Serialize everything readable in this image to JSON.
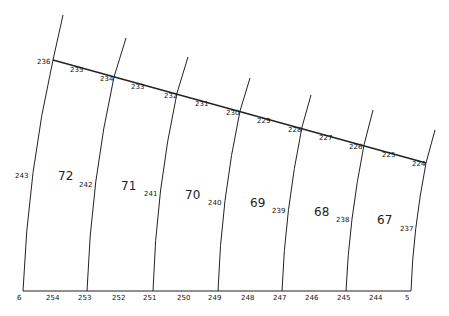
{
  "title": "",
  "diagram": {
    "lots": [
      {
        "number": "72",
        "x": 58,
        "y": 180
      },
      {
        "number": "71",
        "x": 121,
        "y": 190
      },
      {
        "number": "70",
        "x": 185,
        "y": 199
      },
      {
        "number": "69",
        "x": 250,
        "y": 207
      },
      {
        "number": "68",
        "x": 314,
        "y": 216
      },
      {
        "number": "67",
        "x": 377,
        "y": 224
      }
    ],
    "top_boundary_points": [
      {
        "label": "236",
        "x": 37,
        "y": 64
      },
      {
        "label": "235",
        "x": 70,
        "y": 72
      },
      {
        "label": "234",
        "x": 100,
        "y": 81
      },
      {
        "label": "233",
        "x": 131,
        "y": 89
      },
      {
        "label": "232",
        "x": 164,
        "y": 98
      },
      {
        "label": "231",
        "x": 195,
        "y": 106
      },
      {
        "label": "230",
        "x": 226,
        "y": 115
      },
      {
        "label": "229",
        "x": 257,
        "y": 123
      },
      {
        "label": "228",
        "x": 288,
        "y": 132
      },
      {
        "label": "227",
        "x": 319,
        "y": 140
      },
      {
        "label": "226",
        "x": 349,
        "y": 149
      },
      {
        "label": "225",
        "x": 382,
        "y": 157
      },
      {
        "label": "224",
        "x": 412,
        "y": 166
      }
    ],
    "side_points": [
      {
        "label": "243",
        "x": 15,
        "y": 178
      },
      {
        "label": "242",
        "x": 79,
        "y": 187
      },
      {
        "label": "241",
        "x": 144,
        "y": 196
      },
      {
        "label": "240",
        "x": 208,
        "y": 205
      },
      {
        "label": "239",
        "x": 272,
        "y": 213
      },
      {
        "label": "238",
        "x": 336,
        "y": 222
      },
      {
        "label": "237",
        "x": 400,
        "y": 231
      }
    ],
    "bottom_points": [
      {
        "label": "6",
        "x": 17,
        "y": 300
      },
      {
        "label": "254",
        "x": 46,
        "y": 300
      },
      {
        "label": "253",
        "x": 78,
        "y": 300
      },
      {
        "label": "252",
        "x": 112,
        "y": 300
      },
      {
        "label": "251",
        "x": 143,
        "y": 300
      },
      {
        "label": "250",
        "x": 177,
        "y": 300
      },
      {
        "label": "249",
        "x": 208,
        "y": 300
      },
      {
        "label": "248",
        "x": 241,
        "y": 300
      },
      {
        "label": "247",
        "x": 273,
        "y": 300
      },
      {
        "label": "246",
        "x": 305,
        "y": 300
      },
      {
        "label": "245",
        "x": 337,
        "y": 300
      },
      {
        "label": "244",
        "x": 369,
        "y": 300
      },
      {
        "label": "5",
        "x": 405,
        "y": 300
      }
    ],
    "dividers": [
      {
        "top_x": 63,
        "top_y": 15,
        "mid_x": 53,
        "mid_y": 60,
        "ctrl_x": 28,
        "ctrl_y": 170,
        "bot_x": 23
      },
      {
        "top_x": 126,
        "top_y": 38,
        "mid_x": 114,
        "mid_y": 77,
        "ctrl_x": 91,
        "ctrl_y": 180,
        "bot_x": 87
      },
      {
        "top_x": 188,
        "top_y": 57,
        "mid_x": 177,
        "mid_y": 93,
        "ctrl_x": 156,
        "ctrl_y": 190,
        "bot_x": 153
      },
      {
        "top_x": 250,
        "top_y": 78,
        "mid_x": 240,
        "mid_y": 111,
        "ctrl_x": 221,
        "ctrl_y": 200,
        "bot_x": 218
      },
      {
        "top_x": 311,
        "top_y": 95,
        "mid_x": 302,
        "mid_y": 127,
        "ctrl_x": 285,
        "ctrl_y": 210,
        "bot_x": 282
      },
      {
        "top_x": 373,
        "top_y": 110,
        "mid_x": 364,
        "mid_y": 145,
        "ctrl_x": 349,
        "ctrl_y": 220,
        "bot_x": 346
      },
      {
        "top_x": 435,
        "top_y": 130,
        "mid_x": 426,
        "mid_y": 163,
        "ctrl_x": 413,
        "ctrl_y": 230,
        "bot_x": 411
      }
    ],
    "bottom_y": 291
  }
}
